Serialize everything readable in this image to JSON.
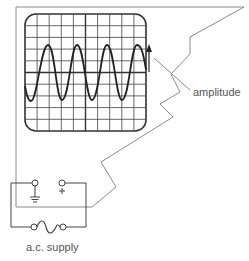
{
  "figure": {
    "labels": {
      "amplitude": "amplitude",
      "supply": "a.c. supply"
    },
    "terminals": {
      "positive_symbol": "+",
      "ground_symbol": "ground"
    },
    "screen": {
      "grid_columns": 10,
      "grid_rows": 10,
      "wave_cycles": 4
    },
    "colors": {
      "wire": "#8a8a8a",
      "screen_line": "#333333",
      "text": "#555555",
      "background": "#ffffff"
    }
  }
}
